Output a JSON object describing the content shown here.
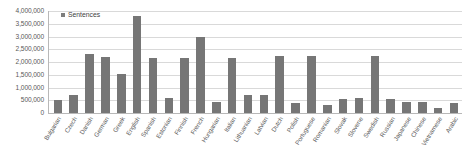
{
  "chart_data": {
    "type": "bar",
    "title": "",
    "subtitle": "",
    "xlabel": "",
    "ylabel": "",
    "ylim": [
      0,
      4000000
    ],
    "ytick_step": 500000,
    "ytick_labels": [
      "4,000,000",
      "3,500,000",
      "3,000,000",
      "2,500,000",
      "2,000,000",
      "1,500,000",
      "1,000,000",
      "500,000",
      "0"
    ],
    "ytick_values": [
      4000000,
      3500000,
      3000000,
      2500000,
      2000000,
      1500000,
      1000000,
      500000,
      0
    ],
    "grid": true,
    "legend": {
      "position": "top-left-inside",
      "entries": [
        {
          "name": "Sentences",
          "color": "#767676",
          "marker": "legend-square-marker"
        }
      ]
    },
    "series_name": "Sentences",
    "bar_color": "#767676",
    "categories": [
      "Bulgarian",
      "Czech",
      "Danish",
      "German",
      "Greek",
      "English",
      "Spanish",
      "Estonian",
      "Finnish",
      "French",
      "Hungarian",
      "Italian",
      "Lithuanian",
      "Latvian",
      "Dutch",
      "Polish",
      "Portuguese",
      "Romanian",
      "Slovak",
      "Slovene",
      "Swedish",
      "Russian",
      "Japanese",
      "Chinese",
      "Vietnamese",
      "Arabic"
    ],
    "values": [
      500000,
      700000,
      2320000,
      2180000,
      1520000,
      3800000,
      2150000,
      600000,
      2150000,
      2980000,
      450000,
      2150000,
      700000,
      700000,
      2250000,
      400000,
      2250000,
      300000,
      550000,
      570000,
      2250000,
      550000,
      420000,
      420000,
      200000,
      400000
    ],
    "series": [
      {
        "name": "Sentences",
        "color": "#767676",
        "values": [
          500000,
          700000,
          2320000,
          2180000,
          1520000,
          3800000,
          2150000,
          600000,
          2150000,
          2980000,
          450000,
          2150000,
          700000,
          700000,
          2250000,
          400000,
          2250000,
          300000,
          550000,
          570000,
          2250000,
          550000,
          420000,
          420000,
          200000,
          400000
        ]
      }
    ]
  }
}
